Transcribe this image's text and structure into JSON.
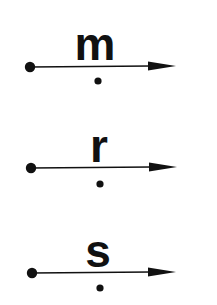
{
  "diagram": {
    "colors": {
      "ink": "#111111",
      "background": "#ffffff"
    },
    "rays": [
      {
        "label": "m",
        "endpoint": {
          "x": 30,
          "y": 67
        },
        "arrow_tip": {
          "x": 176,
          "y": 66
        },
        "label_pos": {
          "x": 95,
          "y": 60
        },
        "label_size": 46,
        "point_below": {
          "x": 98,
          "y": 81
        }
      },
      {
        "label": "r",
        "endpoint": {
          "x": 31,
          "y": 168
        },
        "arrow_tip": {
          "x": 177,
          "y": 167
        },
        "label_pos": {
          "x": 99,
          "y": 162
        },
        "label_size": 46,
        "point_below": {
          "x": 100,
          "y": 184
        }
      },
      {
        "label": "s",
        "endpoint": {
          "x": 32,
          "y": 273
        },
        "arrow_tip": {
          "x": 176,
          "y": 272
        },
        "label_pos": {
          "x": 98,
          "y": 267
        },
        "label_size": 46,
        "point_below": {
          "x": 100,
          "y": 288
        }
      }
    ]
  }
}
